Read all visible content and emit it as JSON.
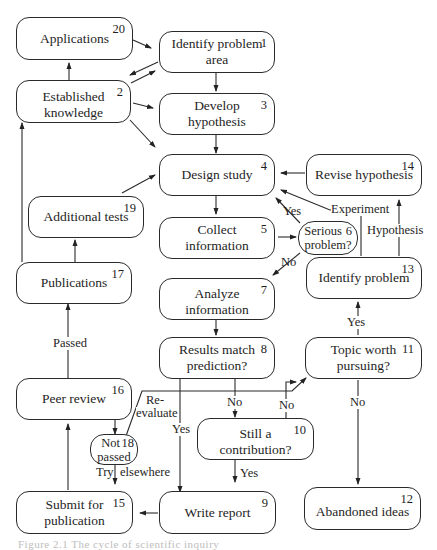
{
  "diagram": {
    "type": "flowchart",
    "nodes": [
      {
        "id": 1,
        "num": "1",
        "label": "Identify problem area"
      },
      {
        "id": 2,
        "num": "2",
        "label": "Established knowledge"
      },
      {
        "id": 3,
        "num": "3",
        "label": "Develop hypothesis"
      },
      {
        "id": 4,
        "num": "4",
        "label": "Design study"
      },
      {
        "id": 5,
        "num": "5",
        "label": "Collect information"
      },
      {
        "id": 6,
        "num": "6",
        "label": "Serious problem?"
      },
      {
        "id": 7,
        "num": "7",
        "label": "Analyze information"
      },
      {
        "id": 8,
        "num": "8",
        "label": "Results match prediction?"
      },
      {
        "id": 9,
        "num": "9",
        "label": "Write report"
      },
      {
        "id": 10,
        "num": "10",
        "label": "Still a contribution?"
      },
      {
        "id": 11,
        "num": "11",
        "label": "Topic worth pursuing?"
      },
      {
        "id": 12,
        "num": "12",
        "label": "Abandoned ideas"
      },
      {
        "id": 13,
        "num": "13",
        "label": "Identify problem"
      },
      {
        "id": 14,
        "num": "14",
        "label": "Revise hypothesis"
      },
      {
        "id": 15,
        "num": "15",
        "label": "Submit for publication"
      },
      {
        "id": 16,
        "num": "16",
        "label": "Peer review"
      },
      {
        "id": 17,
        "num": "17",
        "label": "Publications"
      },
      {
        "id": 18,
        "num": "18",
        "label": "Not passed"
      },
      {
        "id": 19,
        "num": "19",
        "label": "Additional tests"
      },
      {
        "id": 20,
        "num": "20",
        "label": "Applications"
      }
    ],
    "node_text": {
      "n1": "Identify problem area",
      "n2": "Established knowledge",
      "n3": "Develop hypothesis",
      "n4": "Design study",
      "n5": "Collect information",
      "n6a": "Serious",
      "n6b": "problem?",
      "n7": "Analyze information",
      "n8a": "Results match",
      "n8b": "prediction?",
      "n9": "Write report",
      "n10": "Still a contribution?",
      "n11a": "Topic worth",
      "n11b": "pursuing?",
      "n12": "Abandoned ideas",
      "n13": "Identify problem",
      "n14": "Revise hypothesis",
      "n15a": "Submit for",
      "n15b": "publication",
      "n16": "Peer review",
      "n17": "Publications",
      "n18a": "Not",
      "n18b": "passed",
      "n19": "Additional tests",
      "n20": "Applications"
    },
    "edge_labels": {
      "yes_6_4": "Yes",
      "no_6_7": "No",
      "experiment": "Experiment",
      "hypothesis": "Hypothesis",
      "yes_11_13": "Yes",
      "no_8_10": "No",
      "no_10_11": "No",
      "no_11_12": "No",
      "yes_8_9": "Yes",
      "yes_10_9": "Yes",
      "passed": "Passed",
      "reevaluate_a": "Re-",
      "reevaluate_b": "evaluate",
      "try": "Try",
      "elsewhere": "elsewhere"
    },
    "edges": [
      {
        "from": 20,
        "to": 1
      },
      {
        "from": 1,
        "to": 2
      },
      {
        "from": 2,
        "to": 1
      },
      {
        "from": 2,
        "to": 20
      },
      {
        "from": 2,
        "to": 3
      },
      {
        "from": 2,
        "to": 4
      },
      {
        "from": 1,
        "to": 3
      },
      {
        "from": 3,
        "to": 4
      },
      {
        "from": 4,
        "to": 5
      },
      {
        "from": 5,
        "to": 6
      },
      {
        "from": 6,
        "to": 4,
        "label": "Yes"
      },
      {
        "from": 6,
        "to": 7,
        "label": "No"
      },
      {
        "from": 13,
        "to": 4,
        "label": "Experiment"
      },
      {
        "from": 13,
        "to": 14,
        "label": "Hypothesis"
      },
      {
        "from": 14,
        "to": 4
      },
      {
        "from": 7,
        "to": 8
      },
      {
        "from": 8,
        "to": 9,
        "label": "Yes"
      },
      {
        "from": 8,
        "to": 10,
        "label": "No"
      },
      {
        "from": 10,
        "to": 9,
        "label": "Yes"
      },
      {
        "from": 10,
        "to": 11,
        "label": "No"
      },
      {
        "from": 11,
        "to": 13,
        "label": "Yes"
      },
      {
        "from": 11,
        "to": 12,
        "label": "No"
      },
      {
        "from": 9,
        "to": 15
      },
      {
        "from": 15,
        "to": 16
      },
      {
        "from": 16,
        "to": 18
      },
      {
        "from": 18,
        "to": 15,
        "label": "Try elsewhere"
      },
      {
        "from": 18,
        "to": 11,
        "label": "Re-evaluate"
      },
      {
        "from": 16,
        "to": 17,
        "label": "Passed"
      },
      {
        "from": 17,
        "to": 19
      },
      {
        "from": 17,
        "to": 2
      },
      {
        "from": 19,
        "to": 4
      }
    ]
  },
  "caption": "Figure 2.1  The cycle of scientific inquiry"
}
